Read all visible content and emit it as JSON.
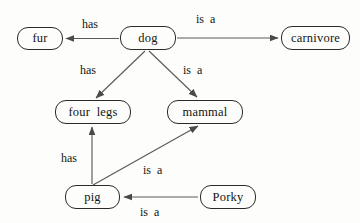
{
  "diagram": {
    "background_color": "#fdfdfb",
    "line_color": "#5a5a58",
    "border_color": "#2a2a2a",
    "text_color": "#14140f",
    "nodes": [
      {
        "id": "fur",
        "label": "fur",
        "x": 17,
        "y": 27,
        "w": 46,
        "h": 23
      },
      {
        "id": "dog",
        "label": "dog",
        "x": 120,
        "y": 26,
        "w": 56,
        "h": 24
      },
      {
        "id": "carnivore",
        "label": "carnivore",
        "x": 281,
        "y": 26,
        "w": 69,
        "h": 24
      },
      {
        "id": "four_legs",
        "label": "four  legs",
        "x": 55,
        "y": 100,
        "w": 76,
        "h": 24
      },
      {
        "id": "mammal",
        "label": "mammal",
        "x": 167,
        "y": 100,
        "w": 76,
        "h": 24
      },
      {
        "id": "pig",
        "label": "pig",
        "x": 65,
        "y": 185,
        "w": 55,
        "h": 24
      },
      {
        "id": "porky",
        "label": "Porky",
        "x": 200,
        "y": 185,
        "w": 56,
        "h": 24
      }
    ],
    "edges": [
      {
        "id": "dog-has-fur",
        "from": "dog",
        "to": "fur",
        "label": "has",
        "label_x": 82,
        "label_y": 18
      },
      {
        "id": "dog-isa-carnivore",
        "from": "dog",
        "to": "carnivore",
        "label": "is  a",
        "label_x": 196,
        "label_y": 13
      },
      {
        "id": "dog-has-four-legs",
        "from": "dog",
        "to": "four_legs",
        "label": "has",
        "label_x": 80,
        "label_y": 64
      },
      {
        "id": "dog-isa-mammal",
        "from": "dog",
        "to": "mammal",
        "label": "is  a",
        "label_x": 183,
        "label_y": 64
      },
      {
        "id": "pig-has-four-legs",
        "from": "pig",
        "to": "four_legs",
        "label": "has",
        "label_x": 61,
        "label_y": 152
      },
      {
        "id": "pig-isa-mammal",
        "from": "pig",
        "to": "mammal",
        "label": "is  a",
        "label_x": 143,
        "label_y": 164
      },
      {
        "id": "porky-isa-pig",
        "from": "porky",
        "to": "pig",
        "label": "is  a",
        "label_x": 140,
        "label_y": 206
      }
    ]
  }
}
